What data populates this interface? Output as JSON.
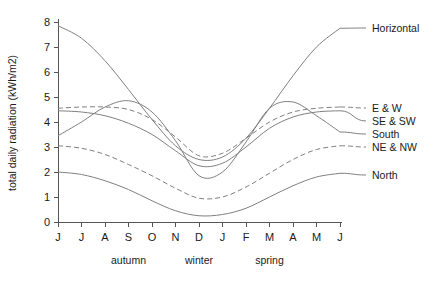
{
  "chart_data": {
    "type": "line",
    "title": "",
    "xlabel": "",
    "ylabel": "total daily radiation (kWh/m2)",
    "xlim": [
      0,
      12
    ],
    "ylim": [
      0,
      8
    ],
    "grid": false,
    "legend_position": "right-inline-labels",
    "x_tick_labels": [
      "J",
      "J",
      "A",
      "S",
      "O",
      "N",
      "D",
      "J",
      "F",
      "M",
      "A",
      "M",
      "J"
    ],
    "y_tick_labels": [
      "0",
      "1",
      "2",
      "3",
      "4",
      "5",
      "6",
      "7",
      "8"
    ],
    "y_ticks": [
      0,
      1,
      2,
      3,
      4,
      5,
      6,
      7,
      8
    ],
    "season_bands": [
      {
        "label": "autumn",
        "center_index": 3
      },
      {
        "label": "winter",
        "center_index": 6
      },
      {
        "label": "spring",
        "center_index": 9
      }
    ],
    "x": [
      0,
      1,
      2,
      3,
      4,
      5,
      6,
      7,
      8,
      9,
      10,
      11,
      12
    ],
    "series": [
      {
        "name": "Horizontal",
        "label": "Horizontal",
        "style": "solid",
        "color": "#808080",
        "values": [
          7.85,
          7.35,
          6.45,
          5.3,
          4.1,
          3.05,
          2.5,
          2.6,
          3.35,
          4.55,
          5.85,
          7.0,
          7.75
        ]
      },
      {
        "name": "E & W",
        "label": "E & W",
        "style": "dashed",
        "color": "#808080",
        "values": [
          4.55,
          4.6,
          4.6,
          4.5,
          4.1,
          3.4,
          2.65,
          2.75,
          3.35,
          4.0,
          4.4,
          4.55,
          4.6
        ]
      },
      {
        "name": "SE & SW",
        "label": "SE & SW",
        "style": "solid",
        "color": "#808080",
        "values": [
          4.45,
          4.4,
          4.25,
          3.95,
          3.5,
          2.85,
          2.25,
          2.35,
          3.0,
          3.75,
          4.2,
          4.4,
          4.45
        ]
      },
      {
        "name": "South",
        "label": "South",
        "style": "solid",
        "color": "#808080",
        "values": [
          3.45,
          4.0,
          4.6,
          4.85,
          4.4,
          3.25,
          1.85,
          2.0,
          3.2,
          4.55,
          4.8,
          4.25,
          3.6
        ]
      },
      {
        "name": "NE & NW",
        "label": "NE & NW",
        "style": "dashed",
        "color": "#808080",
        "values": [
          3.05,
          2.95,
          2.7,
          2.3,
          1.85,
          1.35,
          0.95,
          1.0,
          1.4,
          1.95,
          2.5,
          2.9,
          3.05
        ]
      },
      {
        "name": "North",
        "label": "North",
        "style": "solid",
        "color": "#808080",
        "values": [
          2.0,
          1.9,
          1.65,
          1.3,
          0.85,
          0.45,
          0.25,
          0.3,
          0.55,
          1.0,
          1.45,
          1.8,
          1.95
        ]
      }
    ],
    "label_anchors": [
      {
        "name": "Horizontal",
        "x": 372,
        "y": 28
      },
      {
        "name": "E & W",
        "x": 372,
        "y": 108
      },
      {
        "name": "SE & SW",
        "x": 372,
        "y": 121
      },
      {
        "name": "South",
        "x": 372,
        "y": 134
      },
      {
        "name": "NE & NW",
        "x": 372,
        "y": 147
      },
      {
        "name": "North",
        "x": 372,
        "y": 175
      }
    ]
  }
}
